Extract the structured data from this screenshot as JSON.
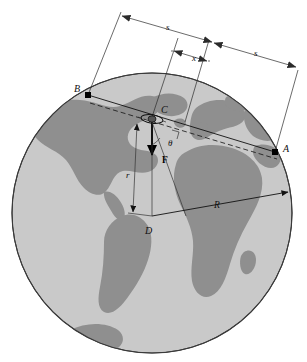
{
  "figure": {
    "background_color": "#ffffff",
    "globe": {
      "ocean_color": "#c9c9c9",
      "land_color": "#8f8f8f",
      "outline_color": "#3a3a3a",
      "center_x": 152,
      "center_y": 213,
      "radius": 140
    },
    "points": [
      {
        "id": "A",
        "label": "A",
        "x": 275,
        "y": 152,
        "label_x": 284,
        "label_y": 152,
        "style": "italic",
        "marker": true
      },
      {
        "id": "B",
        "label": "B",
        "x": 88,
        "y": 95,
        "label_x": 78,
        "label_y": 92,
        "style": "italic",
        "marker": true
      },
      {
        "id": "C",
        "label": "C",
        "x": 152,
        "y": 117,
        "label_x": 162,
        "label_y": 112,
        "style": "italic",
        "marker": false
      },
      {
        "id": "D",
        "label": "D",
        "x": 152,
        "y": 216,
        "label_x": 146,
        "label_y": 232,
        "style": "italic",
        "marker": false
      }
    ],
    "dimensions": [
      {
        "id": "s-left",
        "label": "s",
        "label_x": 166,
        "label_y": 30,
        "style": "italic"
      },
      {
        "id": "x-middle",
        "label": "x",
        "label_x": 192,
        "label_y": 61,
        "style": "italic"
      },
      {
        "id": "s-right",
        "label": "s",
        "label_x": 254,
        "label_y": 56,
        "style": "italic"
      }
    ],
    "annotations": [
      {
        "id": "force-vector",
        "label": "F",
        "label_x": 162,
        "label_y": 161,
        "style": "bold"
      },
      {
        "id": "angle-theta",
        "label": "θ",
        "label_x": 170,
        "label_y": 144,
        "style": "italic"
      },
      {
        "id": "radius-r",
        "label": "r",
        "label_x": 128,
        "label_y": 176,
        "style": "italic"
      },
      {
        "id": "radius-R",
        "label": "R",
        "label_x": 216,
        "label_y": 206,
        "style": "italic"
      }
    ],
    "satellite": {
      "id": "satellite-icon",
      "x": 152,
      "y": 119,
      "description": "small satellite at point C"
    },
    "right_angle_marker": {
      "id": "right-angle-marker",
      "x": 177,
      "y": 134
    }
  }
}
